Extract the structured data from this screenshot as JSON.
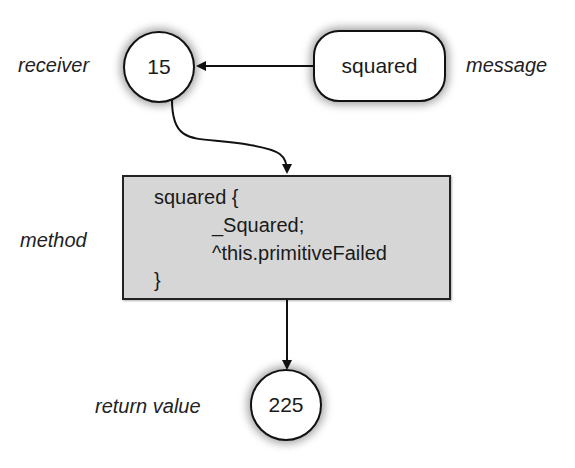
{
  "diagram": {
    "receiver": {
      "label": "receiver",
      "value": "15"
    },
    "message": {
      "label": "message",
      "value": "squared"
    },
    "method": {
      "label": "method",
      "code_lines": [
        "squared {",
        "_Squared;",
        "^this.primitiveFailed",
        "}"
      ]
    },
    "return_value": {
      "label": "return value",
      "value": "225"
    },
    "colors": {
      "box_fill": "#d6d6d6",
      "stroke": "#111111",
      "background": "#ffffff"
    }
  }
}
